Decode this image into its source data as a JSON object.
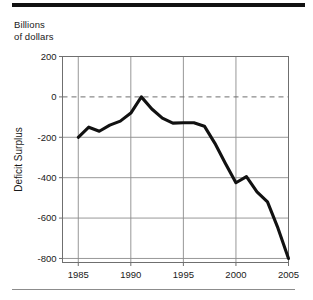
{
  "figure": {
    "unit_label": "Billions\nof dollars",
    "top_rule_color": "#111111",
    "bottom_rule_color": "#8c8c8c"
  },
  "chart_data": {
    "type": "line",
    "title": "",
    "subtitle": "",
    "unit_note": "Billions of dollars",
    "xlabel": "",
    "ylabel": "Deficit  Surplus",
    "ylabel_parts": [
      "Deficit",
      "Surplus"
    ],
    "xlim": [
      1983.5,
      2005
    ],
    "ylim": [
      -820,
      200
    ],
    "yticks": [
      200,
      0,
      -200,
      -400,
      -600,
      -800
    ],
    "ytick_labels": [
      "200",
      "0",
      "-200",
      "-400",
      "-600",
      "-800"
    ],
    "xticks": [
      1985,
      1990,
      1995,
      2000,
      2005
    ],
    "xtick_labels": [
      "1985",
      "1990",
      "1995",
      "2000",
      "2005"
    ],
    "grid": true,
    "gridlines_horizontal": [
      200,
      -200,
      -400,
      -600,
      -800
    ],
    "zero_line": 0,
    "zero_line_style": "dashed",
    "legend": "none",
    "line_color": "#111111",
    "grid_color": "#8c8c8c",
    "frame_color": "#6f6f6f",
    "x": [
      1985,
      1986,
      1987,
      1988,
      1989,
      1990,
      1991,
      1992,
      1993,
      1994,
      1995,
      1996,
      1997,
      1998,
      1999,
      2000,
      2001,
      2002,
      2003,
      2004,
      2005
    ],
    "values": [
      -200,
      -150,
      -170,
      -140,
      -120,
      -80,
      0,
      -60,
      -105,
      -130,
      -128,
      -128,
      -145,
      -230,
      -330,
      -425,
      -395,
      -470,
      -520,
      -650,
      -800
    ],
    "series": [
      {
        "name": "Deficit / Surplus",
        "values": [
          -200,
          -150,
          -170,
          -140,
          -120,
          -80,
          0,
          -60,
          -105,
          -130,
          -128,
          -128,
          -145,
          -230,
          -330,
          -425,
          -395,
          -470,
          -520,
          -650,
          -800
        ]
      }
    ]
  }
}
